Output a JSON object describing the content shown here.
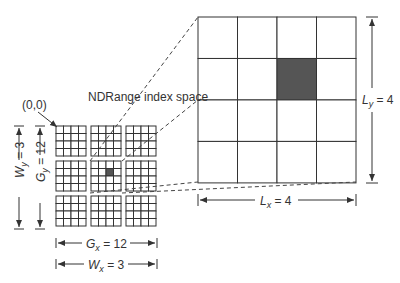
{
  "title": "NDRange index space",
  "origin_label": "(0,0)",
  "small_grid": {
    "tiles_x": 3,
    "tiles_y": 3,
    "cells_per_tile": 4,
    "highlight": {
      "tile_x": 1,
      "tile_y": 1,
      "cell_x": 2,
      "cell_y": 1
    }
  },
  "large_grid": {
    "cells_x": 4,
    "cells_y": 4,
    "highlight": {
      "cell_x": 2,
      "cell_y": 1
    }
  },
  "dimensions": {
    "Wy": {
      "var": "W",
      "sub": "y",
      "value": "= 3"
    },
    "Gy": {
      "var": "G",
      "sub": "y",
      "value": "= 12"
    },
    "Gx": {
      "var": "G",
      "sub": "x",
      "value": "= 12"
    },
    "Wx": {
      "var": "W",
      "sub": "x",
      "value": "= 3"
    },
    "Lx": {
      "var": "L",
      "sub": "x",
      "value": "= 4"
    },
    "Ly": {
      "var": "L",
      "sub": "y",
      "value": "= 4"
    }
  },
  "colors": {
    "line": "#333333",
    "highlight": "#555555"
  }
}
